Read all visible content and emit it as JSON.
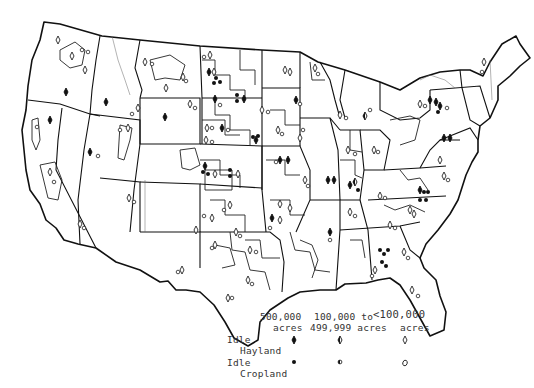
{
  "map": {
    "subject": "Idle hayland and idle cropland by region, conterminous United States",
    "line_color": "#111111",
    "background": "#ffffff"
  },
  "legend": {
    "columns": [
      {
        "line1": "500,000",
        "line2": "acres"
      },
      {
        "line1": "100,000 to",
        "line2": "499,999 acres"
      },
      {
        "line1": "<100,000",
        "line2": "acres"
      }
    ],
    "rows": [
      {
        "line1": "Idle",
        "line2": "Hayland",
        "symbols": [
          "filled-diamond",
          "half-filled-diamond",
          "open-diamond"
        ]
      },
      {
        "line1": "Idle",
        "line2": "Cropland",
        "symbols": [
          "filled-circle",
          "half-filled-circle",
          "open-circle"
        ]
      }
    ]
  }
}
